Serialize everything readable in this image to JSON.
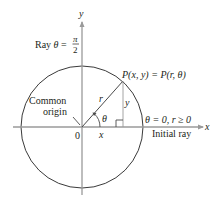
{
  "figure": {
    "type": "polar-coordinates-diagram",
    "colors": {
      "axis": "#9a9a9a",
      "circle": "#3a3a3a",
      "line": "#4a4a4a",
      "text": "#231f20"
    }
  },
  "axes": {
    "x_label": "x",
    "y_label": "y",
    "origin_label": "0"
  },
  "labels": {
    "ray_prefix": "Ray ",
    "ray_theta": "θ",
    "ray_equals": " = ",
    "ray_numerator": "π",
    "ray_denominator": "2",
    "point": "P(x, y) = P(r, θ)",
    "radius": "r",
    "angle": "θ",
    "x_leg": "x",
    "y_leg": "y",
    "common_origin_line1": "Common",
    "common_origin_line2": "origin",
    "initial_condition": "θ = 0, r ≥ 0",
    "initial_ray": "Initial ray"
  }
}
